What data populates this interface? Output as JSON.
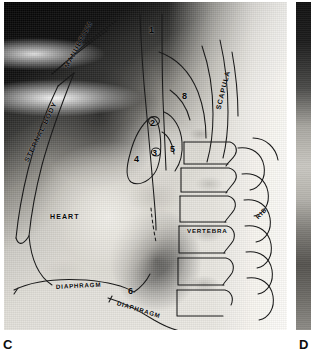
{
  "figure": {
    "type": "lateral-chest-radiograph-with-line-drawing-overlay",
    "panels": [
      {
        "letter": "C",
        "caption_letter": "C"
      },
      {
        "letter": "D",
        "caption_letter": "D"
      }
    ]
  },
  "panel_c": {
    "letter": "C",
    "labels": {
      "sternal_body": "STERNAL BODY",
      "manubrium": "MANUBRIUM",
      "scapula": "SCAPULA",
      "heart": "HEART",
      "vertebra": "VERTEBRA",
      "rib": "RIB",
      "diaphragm_upper": "DIAPHRAGM",
      "diaphragm_lower": "DIAPHRAGM"
    },
    "numeric_markers": [
      {
        "id": "1",
        "label": "1"
      },
      {
        "id": "2",
        "label": "2"
      },
      {
        "id": "3",
        "label": "3"
      },
      {
        "id": "4",
        "label": "4"
      },
      {
        "id": "5",
        "label": "5"
      },
      {
        "id": "6",
        "label": "6"
      },
      {
        "id": "8",
        "label": "8"
      }
    ]
  },
  "panel_d": {
    "letter": "D"
  },
  "colors": {
    "page_background": "#ffffff",
    "film_dark": "#0a0a0a",
    "film_light": "#e9e7e2",
    "overlay_line": "#1a1a1a",
    "label_text": "#080808"
  }
}
